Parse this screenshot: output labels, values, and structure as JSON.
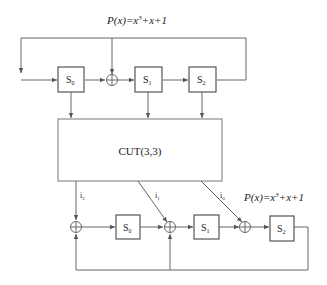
{
  "top_lfsr": {
    "polynomial_label": "P(x)=x³+x+1",
    "registers": [
      "S0",
      "S1",
      "S2"
    ]
  },
  "cut": {
    "label": "CUT(3,3)"
  },
  "bottom_misr": {
    "polynomial_label": "P(x)=x³+x+1",
    "inputs": [
      "i2",
      "i1",
      "i0"
    ],
    "registers": [
      "S0",
      "S1",
      "S2"
    ]
  },
  "colors": {
    "line": "#666666",
    "box_stroke": "#555555",
    "text": "#222222"
  }
}
